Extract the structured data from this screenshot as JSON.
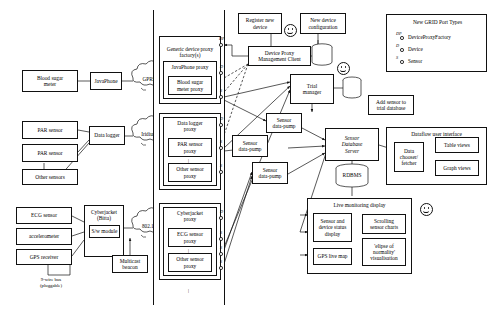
{
  "diagram": {
    "devices_column": {
      "blood_sugar_meter": "Blood sugar\nmeter",
      "javaphone": "JavaPhone",
      "par_sensor_1": "PAR sensor",
      "par_sensor_2": "PAR sensor",
      "other_sensors": "Other sensors",
      "data_logger": "Data logger",
      "ecg_sensor": "ECG sensor",
      "accelerometer": "accelerometer",
      "gps_receiver": "GPS receiver",
      "cyberjacket": "Cyberjacket\n(Bitta)",
      "sw_module": "S/w module",
      "bus_note": "9-wire bus\n(pluggable)"
    },
    "networks": {
      "gprs": "GPRS",
      "iridium": "Iridium",
      "wifi": "802.11",
      "multicast_beacon": "Multicast\nbeacon"
    },
    "proxies": {
      "generic_factory": "Generic device proxy\nfactory(s)",
      "javaphone_proxy": "JavaPhone proxy",
      "blood_sugar_meter_proxy": "Blood sugar\nmeter proxy",
      "data_logger_proxy": "Data logger\nproxy",
      "par_sensor_proxy": "PAR sensor\nproxy",
      "other_sensor_proxy_1": "Other sensor\nproxy",
      "cyberjacket_proxy": "Cyberjacket\nproxy",
      "ecg_sensor_proxy": "ECG sensor\nproxy",
      "other_sensor_proxy_2": "Other sensor\nproxy"
    },
    "port_tags": {
      "device_proxy_factory": "DP",
      "device": "D",
      "sensor": "S"
    },
    "management": {
      "register_new_device": "Register new\ndevice",
      "new_device_configuration": "New device\nconfiguration",
      "device_proxy_management_client": "Device Proxy\nManagement Client",
      "trial_manager": "Trial\nmanager",
      "add_sensor_to_trial_database": "Add sensor to\ntrial database"
    },
    "datapath": {
      "sensor_data_pump_1": "Sensor\ndata-pump",
      "sensor_data_pump_2": "Sensor\ndata-pump",
      "sensor_data_pump_3": "Sensor\ndata-pump",
      "sensor_database_server": "Sensor\nDatabase\nServer",
      "rdbms": "RDBMS"
    },
    "dataflow_ui": {
      "title": "Dataflow user interface",
      "data_chooser_fetcher": "Data\nchooser/\nfetcher",
      "table_views": "Table views",
      "graph_views": "Graph views"
    },
    "live_monitoring": {
      "title": "Live monitoring display",
      "sensor_device_status_display": "Sensor and\ndevice status\ndisplay",
      "scrolling_sensor_charts": "Scrolling\nsensor charts",
      "gps_live_map": "GPS live map",
      "ellipse_visualisation": "'elipse of\nnormality'\nvisualisation"
    },
    "legend": {
      "title": "New GRID Port Types",
      "entries": [
        {
          "tag": "DP",
          "label": "DeviceProxyFactory"
        },
        {
          "tag": "D",
          "label": "Device"
        },
        {
          "tag": "S",
          "label": "Sensor"
        }
      ]
    },
    "colors": {
      "stroke": "#111111",
      "background": "#ffffff"
    }
  }
}
